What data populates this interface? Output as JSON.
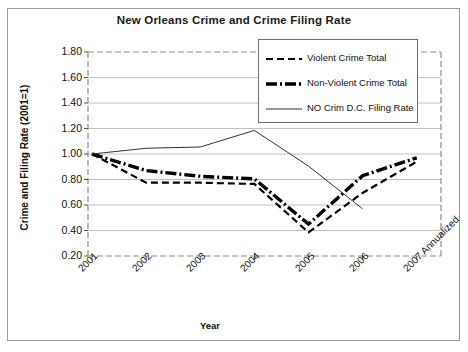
{
  "chart_data": {
    "type": "line",
    "title": "New Orleans Crime and Crime Filing Rate",
    "xlabel": "Year",
    "ylabel": "Crime and Filing Rate (2001=1)",
    "categories": [
      "2001",
      "2002",
      "2003",
      "2004",
      "2005",
      "2006",
      "2007 Annualized"
    ],
    "ylim": [
      0.2,
      1.8
    ],
    "ytick_labels": [
      "1.80",
      "1.60",
      "1.40",
      "1.20",
      "1.00",
      "0.80",
      "0.60",
      "0.40",
      "0.20"
    ],
    "ytick_values": [
      1.8,
      1.6,
      1.4,
      1.2,
      1.0,
      0.8,
      0.6,
      0.4,
      0.2
    ],
    "grid": true,
    "legend_position": "top-right",
    "series": [
      {
        "name": "Violent Crime Total",
        "style": "dashed",
        "color": "#000000",
        "width": 2.2,
        "values": [
          1.0,
          0.775,
          0.775,
          0.765,
          0.385,
          0.695,
          0.94
        ]
      },
      {
        "name": "Non-Violent Crime Total",
        "style": "dash-dot-thick",
        "color": "#000000",
        "width": 3.4,
        "values": [
          1.0,
          0.87,
          0.825,
          0.805,
          0.45,
          0.83,
          0.97
        ]
      },
      {
        "name": "NO Crim D.C. Filing Rate",
        "style": "solid-thin",
        "color": "#333333",
        "width": 1.0,
        "values": [
          1.0,
          1.045,
          1.055,
          1.185,
          0.905,
          0.57,
          null
        ]
      }
    ]
  }
}
